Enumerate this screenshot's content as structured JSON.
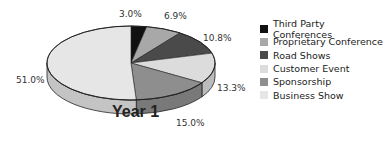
{
  "chart_data": {
    "type": "pie",
    "title": "Year 1",
    "style": "3d",
    "categories": [
      "Third Party Conferences",
      "Proprietary Conference",
      "Road Shows",
      "Customer Event",
      "Sponsorship",
      "Business Show"
    ],
    "values": [
      3.0,
      6.9,
      10.8,
      13.3,
      15.0,
      51.0
    ],
    "labels": [
      "3.0%",
      "6.9%",
      "10.8%",
      "13.3%",
      "15.0%",
      "51.0%"
    ],
    "colors": [
      "#111111",
      "#a8a8a8",
      "#4a4a4a",
      "#dcdcdc",
      "#8e8e8e",
      "#e6e6e6"
    ],
    "legend_position": "right"
  },
  "legend": [
    {
      "label": "Third Party Conferences",
      "color": "#111111"
    },
    {
      "label": "Proprietary Conference",
      "color": "#a8a8a8"
    },
    {
      "label": "Road Shows",
      "color": "#4a4a4a"
    },
    {
      "label": "Customer Event",
      "color": "#dcdcdc"
    },
    {
      "label": "Sponsorship",
      "color": "#8e8e8e"
    },
    {
      "label": "Business Show",
      "color": "#e6e6e6"
    }
  ]
}
